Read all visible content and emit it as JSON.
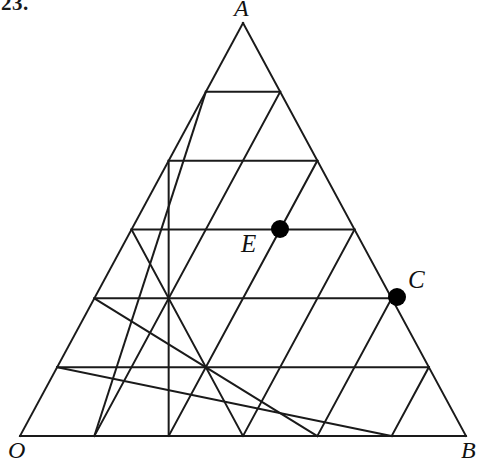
{
  "figure": {
    "problem_number": "23.",
    "type": "triangular-lattice-diagram",
    "background_color": "#ffffff",
    "line_color": "#1a1a1a",
    "line_width": 2,
    "dot_color": "#000000",
    "dot_radius": 9,
    "triangle": {
      "rows": 6,
      "apex": {
        "label": "A",
        "x": 243,
        "y": 23
      },
      "bottom_left": {
        "label": "O",
        "x": 20,
        "y": 436
      },
      "bottom_right": {
        "label": "B",
        "x": 466,
        "y": 436
      },
      "row_spacing": 68.833
    },
    "vertex_labels": [
      {
        "name": "A",
        "text": "A"
      },
      {
        "name": "O",
        "text": "O"
      },
      {
        "name": "B",
        "text": "B"
      }
    ],
    "marked_points": [
      {
        "name": "E",
        "text": "E",
        "x": 280,
        "y": 229,
        "row": 3,
        "col": 4,
        "label_position": "lower-left",
        "on_edge": false
      },
      {
        "name": "C",
        "text": "C",
        "x": 397,
        "y": 297,
        "row": 4,
        "col": 8,
        "label_position": "upper-right",
        "on_edge": true
      }
    ]
  }
}
